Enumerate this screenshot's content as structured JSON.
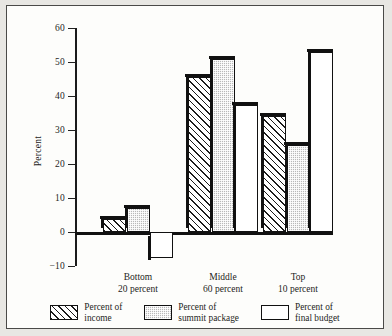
{
  "chart_data": {
    "type": "bar",
    "title": "",
    "subtitle": "",
    "xlabel": "",
    "ylabel": "Percent",
    "ylim": [
      -10,
      60
    ],
    "yticks": [
      60,
      50,
      40,
      30,
      20,
      10,
      0,
      -10
    ],
    "ytick_labels": [
      "60",
      "50",
      "40",
      "30",
      "20",
      "10",
      "0",
      "−10"
    ],
    "grid": false,
    "legend_position": "bottom",
    "categories": [
      "Bottom 20 percent",
      "Middle 60 percent",
      "Top 10 percent"
    ],
    "category_lines": [
      [
        "Bottom",
        "20 percent"
      ],
      [
        "Middle",
        "60 percent"
      ],
      [
        "Top",
        "10 percent"
      ]
    ],
    "series": [
      {
        "name": "Percent of income",
        "fill": "diagonal-hatch",
        "values": [
          3.8,
          45.5,
          34.0
        ]
      },
      {
        "name": "Percent of summit package",
        "fill": "gray-stipple",
        "values": [
          7.2,
          51.0,
          25.5
        ]
      },
      {
        "name": "Percent of final budget",
        "fill": "white",
        "values": [
          -7.5,
          37.5,
          53.0
        ]
      }
    ]
  },
  "legend": {
    "items": [
      {
        "label_line1": "Percent of",
        "label_line2": "income",
        "swatch": "hatch-swatch"
      },
      {
        "label_line1": "Percent of",
        "label_line2": "summit package",
        "swatch": "dots-swatch"
      },
      {
        "label_line1": "Percent of",
        "label_line2": "final budget",
        "swatch": "white-swatch"
      }
    ]
  },
  "colors": {
    "ink": "#1b1b1b",
    "frame": "#4a4a48",
    "paper": "#fdfdfb",
    "page": "#e8e7e3",
    "series_gray": "#b9b9b9"
  }
}
